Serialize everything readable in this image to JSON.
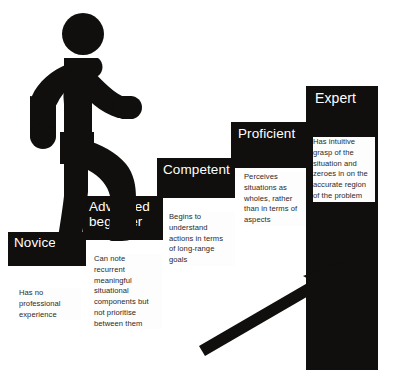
{
  "diagram": {
    "colors": {
      "step_fill": "#100f0d",
      "label_text": "#ffffff",
      "body_text": "#2a2a2a",
      "panel_fill": "#fdfdfd",
      "background": "#ffffff",
      "figure_fill": "#100f0d",
      "arrow_fill": "#100f0d"
    },
    "stages": [
      {
        "id": "novice",
        "label": "Novice",
        "description": "Has no professional experience",
        "lines": [
          "Has no",
          "professional",
          "experience"
        ]
      },
      {
        "id": "advanced-beginner",
        "label": "Advanced beginner",
        "description": "Can note recurrent meaningful situational components but not prioritise between them",
        "lines": [
          "Can note",
          "recurrent",
          "meaningful",
          "situational",
          "components but",
          "not prioritise",
          "between them"
        ]
      },
      {
        "id": "competent",
        "label": "Competent",
        "description": "Begins to understand actions in terms of long-range goals",
        "lines": [
          "Begins to",
          "understand",
          "actions in terms",
          "of long-range",
          "goals"
        ]
      },
      {
        "id": "proficient",
        "label": "Proficient",
        "description": "Perceives situations as wholes, rather than in terms of aspects",
        "lines": [
          "Perceives",
          "situations as",
          "wholes, rather",
          "than in terms of",
          "aspects"
        ]
      },
      {
        "id": "expert",
        "label": "Expert",
        "description": "Has intuitive grasp of the situation and zeroes in on the accurate region of the problem",
        "lines": [
          "Has intuitive",
          "grasp of the",
          "situation and",
          "zeroes in on the",
          "accurate region",
          "of the problem"
        ]
      }
    ],
    "figure": {
      "name": "walking-person-pictogram",
      "direction": "ascending-right"
    },
    "arrow": {
      "name": "upward-progress-arrow",
      "direction": "up-right"
    }
  }
}
